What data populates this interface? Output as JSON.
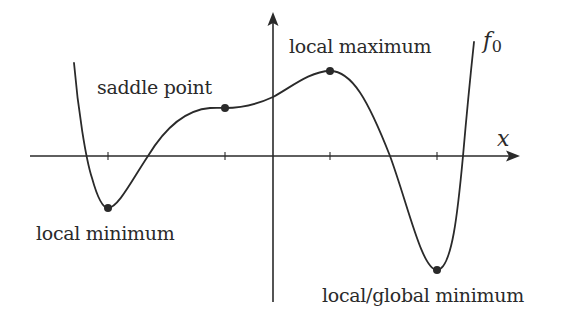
{
  "diagram": {
    "title": "",
    "function_label": "f",
    "function_subscript": "0",
    "x_axis_label": "x",
    "colors": {
      "background": "#ffffff",
      "stroke": "#2a2a2a",
      "text": "#2a2a2a"
    },
    "annotations": [
      {
        "id": "local-minimum",
        "label": "local minimum",
        "point": [
          108,
          208
        ]
      },
      {
        "id": "saddle-point",
        "label": "saddle point",
        "point": [
          225,
          108
        ]
      },
      {
        "id": "local-maximum",
        "label": "local maximum",
        "point": [
          330,
          71
        ]
      },
      {
        "id": "global-minimum",
        "label": "local/global minimum",
        "point": [
          437,
          270
        ]
      }
    ],
    "x_ticks": [
      108,
      225,
      330,
      437
    ]
  }
}
